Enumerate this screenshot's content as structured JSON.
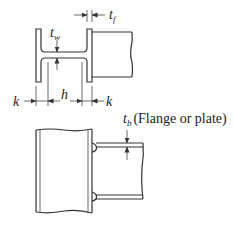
{
  "diagram": {
    "type": "beam-to-column connection",
    "top_view": {
      "name": "column cross-section with beam",
      "labels": {
        "t_f_main": "t",
        "t_f_sub": "f",
        "t_w_main": "t",
        "t_w_sub": "w",
        "k_left": "k",
        "h": "h",
        "k_right": "k"
      }
    },
    "bottom_view": {
      "name": "elevation of column with beam flange plates",
      "labels": {
        "t_b_main": "t",
        "t_b_sub": "b",
        "t_b_note": "(Flange or plate)"
      }
    }
  },
  "colors": {
    "line": "#333333",
    "background": "#ffffff",
    "text": "#222222"
  }
}
